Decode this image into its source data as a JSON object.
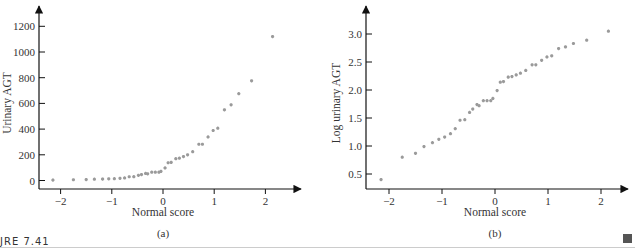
{
  "figure": {
    "caption": "JRE 7.41",
    "end_marker": "square"
  },
  "colors": {
    "axis": "#111111",
    "point": "#9a9a9a",
    "text": "#333333"
  },
  "chart_data": [
    {
      "type": "scatter",
      "panel": "(a)",
      "title": "",
      "xlabel": "Normal score",
      "ylabel": "Urinary AGT",
      "xlim": [
        -2.4,
        2.5
      ],
      "ylim": [
        -50,
        1300
      ],
      "xticks": [
        -2,
        -1,
        0,
        1,
        2
      ],
      "xtick_labels": [
        "−2",
        "−1",
        "0",
        "1",
        "2"
      ],
      "yticks": [
        0,
        200,
        400,
        600,
        800,
        1000,
        1200
      ],
      "ytick_labels": [
        "0",
        "200",
        "400",
        "600",
        "800",
        "1000",
        "1200"
      ],
      "grid": false,
      "legend": null,
      "x": [
        -2.15,
        -1.75,
        -1.5,
        -1.34,
        -1.18,
        -1.06,
        -0.95,
        -0.84,
        -0.75,
        -0.66,
        -0.57,
        -0.48,
        -0.42,
        -0.34,
        -0.3,
        -0.22,
        -0.15,
        -0.08,
        -0.04,
        0.04,
        0.1,
        0.16,
        0.25,
        0.32,
        0.4,
        0.48,
        0.58,
        0.7,
        0.77,
        0.88,
        0.98,
        1.07,
        1.2,
        1.33,
        1.48,
        1.73,
        2.14
      ],
      "y": [
        3,
        6,
        7,
        10,
        11,
        13,
        14,
        17,
        20,
        29,
        30,
        40,
        46,
        55,
        52,
        65,
        65,
        65,
        71,
        98,
        138,
        141,
        170,
        174,
        186,
        200,
        224,
        282,
        282,
        339,
        389,
        407,
        550,
        589,
        676,
        776,
        1120
      ]
    },
    {
      "type": "scatter",
      "panel": "(b)",
      "title": "",
      "xlabel": "Normal score",
      "ylabel": "Log urinary AGT",
      "xlim": [
        -2.4,
        2.5
      ],
      "ylim": [
        0.25,
        3.25
      ],
      "xticks": [
        -2,
        -1,
        0,
        1,
        2
      ],
      "xtick_labels": [
        "−2",
        "−1",
        "0",
        "1",
        "2"
      ],
      "yticks": [
        0.5,
        1.0,
        1.5,
        2.0,
        2.5,
        3.0
      ],
      "ytick_labels": [
        "0.5",
        "1.0",
        "1.5",
        "2.0",
        "2.5",
        "3.0"
      ],
      "grid": false,
      "legend": null,
      "x": [
        -2.15,
        -1.75,
        -1.5,
        -1.34,
        -1.18,
        -1.06,
        -0.95,
        -0.84,
        -0.75,
        -0.66,
        -0.57,
        -0.48,
        -0.42,
        -0.34,
        -0.3,
        -0.22,
        -0.15,
        -0.08,
        -0.04,
        0.04,
        0.1,
        0.16,
        0.25,
        0.32,
        0.4,
        0.48,
        0.58,
        0.7,
        0.77,
        0.88,
        0.98,
        1.07,
        1.2,
        1.33,
        1.48,
        1.73,
        2.14
      ],
      "y": [
        0.4,
        0.8,
        0.87,
        0.99,
        1.06,
        1.12,
        1.16,
        1.22,
        1.31,
        1.46,
        1.47,
        1.6,
        1.66,
        1.74,
        1.72,
        1.81,
        1.81,
        1.81,
        1.85,
        1.99,
        2.14,
        2.15,
        2.23,
        2.24,
        2.27,
        2.3,
        2.35,
        2.45,
        2.45,
        2.53,
        2.59,
        2.61,
        2.74,
        2.77,
        2.83,
        2.89,
        3.05
      ]
    }
  ]
}
